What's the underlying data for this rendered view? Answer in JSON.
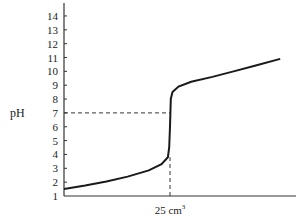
{
  "chart_data": {
    "type": "line",
    "title": "",
    "xlabel": "",
    "ylabel": "pH",
    "ylim": [
      1,
      14.8
    ],
    "xlim": [
      0,
      59
    ],
    "yticks": [
      1,
      2,
      3,
      4,
      5,
      6,
      7,
      8,
      9,
      10,
      11,
      12,
      13,
      14
    ],
    "ytick_labels": [
      "1",
      "2",
      "3",
      "4",
      "5",
      "6",
      "7",
      "8",
      "9",
      "10",
      "11",
      "12",
      "13",
      "14"
    ],
    "xticks": [
      25
    ],
    "xtick_labels": [
      {
        "main": "25 cm",
        "sup": "3"
      }
    ],
    "grid": false,
    "annotations": [
      {
        "type": "dashed-guide",
        "x": 25,
        "y": 7,
        "description": "horizontal dashed line at pH 7 from y-axis to curve"
      },
      {
        "type": "dashed-guide",
        "x": 25,
        "description": "vertical dashed line from baseline up to curve at 25 cm3"
      }
    ],
    "series": [
      {
        "name": "titration curve",
        "color": "#1a1a1a",
        "points": [
          [
            0,
            1.5
          ],
          [
            5,
            1.75
          ],
          [
            10,
            2.05
          ],
          [
            15,
            2.4
          ],
          [
            20,
            2.85
          ],
          [
            23,
            3.3
          ],
          [
            24.5,
            3.8
          ],
          [
            24.8,
            4.5
          ],
          [
            25,
            6.0
          ],
          [
            25.1,
            7.0
          ],
          [
            25.2,
            8.0
          ],
          [
            25.6,
            8.5
          ],
          [
            27,
            8.9
          ],
          [
            30,
            9.25
          ],
          [
            35,
            9.6
          ],
          [
            40,
            10.0
          ],
          [
            45,
            10.4
          ],
          [
            51,
            10.9
          ]
        ]
      }
    ]
  }
}
